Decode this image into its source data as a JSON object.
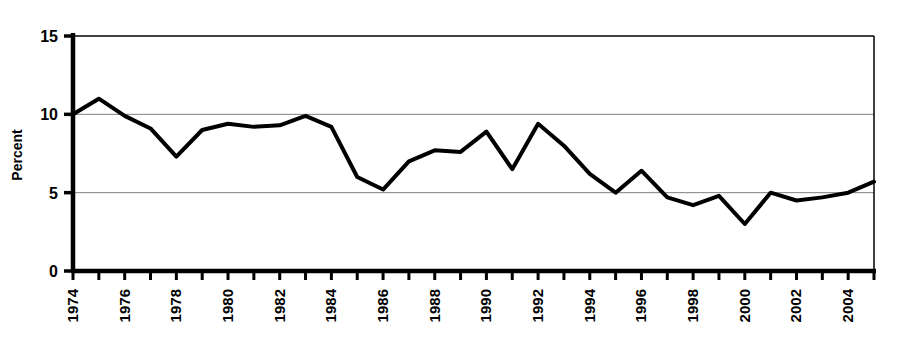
{
  "chart_data": {
    "type": "line",
    "title": "",
    "xlabel": "",
    "ylabel": "Percent",
    "x": [
      1974,
      1975,
      1976,
      1977,
      1978,
      1979,
      1980,
      1981,
      1982,
      1983,
      1984,
      1985,
      1986,
      1987,
      1988,
      1989,
      1990,
      1991,
      1992,
      1993,
      1994,
      1995,
      1996,
      1997,
      1998,
      1999,
      2000,
      2001,
      2002,
      2003,
      2004,
      2005
    ],
    "values": [
      10.0,
      11.0,
      9.9,
      9.1,
      7.3,
      9.0,
      9.4,
      9.2,
      9.3,
      9.9,
      9.2,
      6.0,
      5.2,
      7.0,
      7.7,
      7.6,
      8.9,
      6.5,
      9.4,
      8.0,
      6.2,
      5.0,
      6.4,
      4.7,
      4.2,
      4.8,
      3.0,
      5.0,
      4.5,
      4.7,
      5.0,
      5.7
    ],
    "xlim": [
      1974,
      2005
    ],
    "ylim": [
      0,
      15
    ],
    "ytick_values": [
      0,
      5,
      10,
      15
    ],
    "ytick_labels": [
      "0",
      "5",
      "10",
      "15"
    ],
    "xtick_labels": [
      "1974",
      "1976",
      "1978",
      "1980",
      "1982",
      "1984",
      "1986",
      "1988",
      "1990",
      "1992",
      "1994",
      "1996",
      "1998",
      "2000",
      "2002",
      "2004"
    ],
    "xtick_label_years": [
      1974,
      1976,
      1978,
      1980,
      1982,
      1984,
      1986,
      1988,
      1990,
      1992,
      1994,
      1996,
      1998,
      2000,
      2002,
      2004
    ],
    "xtick_all_years": [
      1974,
      1975,
      1976,
      1977,
      1978,
      1979,
      1980,
      1981,
      1982,
      1983,
      1984,
      1985,
      1986,
      1987,
      1988,
      1989,
      1990,
      1991,
      1992,
      1993,
      1994,
      1995,
      1996,
      1997,
      1998,
      1999,
      2000,
      2001,
      2002,
      2003,
      2004,
      2005
    ],
    "xtick_label_rotation": -90,
    "grid": {
      "horizontal": true,
      "vertical": false,
      "values": [
        5,
        10
      ]
    },
    "legend": null,
    "series_color": "#000000",
    "series_line_width": 4,
    "grid_color": "#808080",
    "axis_color": "#000000",
    "background_color": "#ffffff"
  }
}
